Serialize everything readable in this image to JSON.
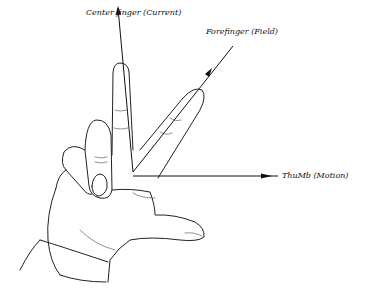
{
  "diagram": {
    "type": "fleming-hand-rule",
    "labels": {
      "center_finger": "Center finger (Current)",
      "forefinger": "Forefinger (Field)",
      "thumb": "ThuMb (Motion)"
    },
    "colors": {
      "ink": "#111111",
      "background": "#ffffff"
    }
  }
}
